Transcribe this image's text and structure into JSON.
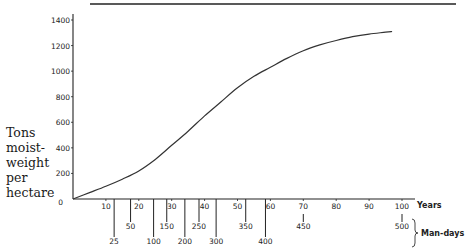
{
  "chart_data": {
    "type": "line",
    "title": "",
    "ylabel_lines": [
      "Tons",
      "moist-",
      "weight",
      "per",
      "hectare"
    ],
    "xlabel": "Years",
    "secondary_xlabel": "Man-days",
    "ylim": [
      0,
      1400
    ],
    "xlim": [
      0,
      100
    ],
    "grid": false,
    "legend": null,
    "y_ticks": [
      0,
      200,
      400,
      600,
      800,
      1000,
      1200,
      1400
    ],
    "x_ticks": [
      10,
      20,
      30,
      40,
      50,
      60,
      70,
      80,
      90,
      100
    ],
    "x_origin_label": "0",
    "man_days_ticks": [
      {
        "label": "25",
        "years": 12.5,
        "row": 2
      },
      {
        "label": "50",
        "years": 17.5,
        "row": 1
      },
      {
        "label": "100",
        "years": 24.5,
        "row": 2
      },
      {
        "label": "150",
        "years": 28.5,
        "row": 1
      },
      {
        "label": "200",
        "years": 34,
        "row": 2
      },
      {
        "label": "250",
        "years": 38.3,
        "row": 1
      },
      {
        "label": "300",
        "years": 43.5,
        "row": 2
      },
      {
        "label": "350",
        "years": 52.5,
        "row": 1
      },
      {
        "label": "400",
        "years": 58.5,
        "row": 2
      },
      {
        "label": "450",
        "years": 70,
        "row": 1
      },
      {
        "label": "500",
        "years": 100,
        "row": 1
      }
    ],
    "series": [
      {
        "name": "Tons moist-weight per hectare",
        "x": [
          0,
          5,
          10,
          15,
          20,
          25,
          30,
          35,
          40,
          45,
          50,
          55,
          60,
          65,
          70,
          75,
          80,
          85,
          90,
          95,
          97
        ],
        "y": [
          0,
          50,
          100,
          155,
          220,
          310,
          420,
          530,
          650,
          760,
          870,
          960,
          1030,
          1100,
          1160,
          1205,
          1240,
          1270,
          1290,
          1305,
          1310
        ]
      }
    ]
  }
}
